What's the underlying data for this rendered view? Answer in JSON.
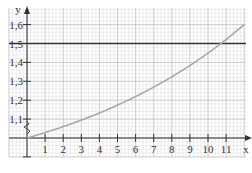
{
  "chart_data": {
    "type": "line",
    "title": "",
    "xlabel": "x",
    "ylabel": "y",
    "x_ticks": [
      "1",
      "2",
      "3",
      "4",
      "5",
      "6",
      "7",
      "8",
      "9",
      "10",
      "11"
    ],
    "y_ticks": [
      "1,1",
      "1,2",
      "1,3",
      "1,4",
      "1,5",
      "1,6"
    ],
    "xlim": [
      0,
      12
    ],
    "ylim": [
      1.0,
      1.65
    ],
    "y_axis_break": true,
    "grid": true,
    "series": [
      {
        "name": "curve",
        "color": "#a8a8a8",
        "x": [
          0,
          1,
          2,
          3,
          4,
          5,
          6,
          7,
          8,
          9,
          10,
          11,
          12
        ],
        "y": [
          1.0,
          1.035,
          1.071,
          1.109,
          1.148,
          1.189,
          1.231,
          1.274,
          1.319,
          1.366,
          1.484,
          1.537,
          1.6
        ]
      },
      {
        "name": "horizontal line y=1.5",
        "color": "#333333",
        "x": [
          0,
          12
        ],
        "y": [
          1.5,
          1.5
        ]
      }
    ],
    "annotations": [
      {
        "text": "intersection near x≈10.2",
        "x": 10.2,
        "y": 1.5
      }
    ]
  }
}
